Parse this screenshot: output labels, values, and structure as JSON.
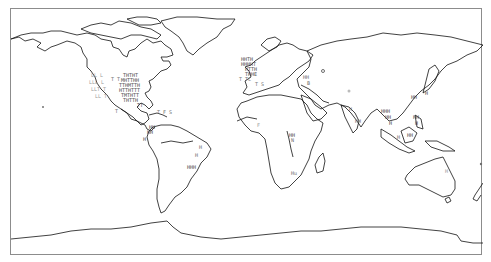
{
  "map": {
    "projection": "equirectangular",
    "frame": {
      "x": 10,
      "y": 8,
      "width": 472,
      "height": 247
    },
    "colors": {
      "coastline": "#111111",
      "frame": "#8c8c8c",
      "marker_dark": "#4a4a4a",
      "marker_mid": "#6e6e6e",
      "marker_light": "#9a9a9a"
    },
    "marker_clusters": [
      {
        "region": "Eastern United States",
        "density": "very high",
        "shade": "dark"
      },
      {
        "region": "Western United States",
        "density": "medium",
        "shade": "light"
      },
      {
        "region": "Western Europe",
        "density": "very high",
        "shade": "dark"
      },
      {
        "region": "Caribbean / Central America",
        "density": "low",
        "shade": "mid"
      },
      {
        "region": "Northern South America (Colombia/Venezuela)",
        "density": "medium",
        "shade": "dark"
      },
      {
        "region": "Eastern Brazil",
        "density": "medium",
        "shade": "mid"
      },
      {
        "region": "East Africa",
        "density": "low",
        "shade": "mid"
      },
      {
        "region": "Southern Africa",
        "density": "low",
        "shade": "mid"
      },
      {
        "region": "Caucasus / Middle East",
        "density": "low",
        "shade": "mid"
      },
      {
        "region": "India",
        "density": "low",
        "shade": "mid"
      },
      {
        "region": "Southeast Asia / Philippines",
        "density": "medium",
        "shade": "dark"
      },
      {
        "region": "Japan",
        "density": "low",
        "shade": "mid"
      },
      {
        "region": "Eastern Australia",
        "density": "low",
        "shade": "light"
      },
      {
        "region": "Pacific islands",
        "density": "very low",
        "shade": "mid"
      }
    ],
    "marker_glyphs": [
      "T",
      "L",
      "I",
      "H",
      "M",
      "F",
      "S",
      "C",
      "E",
      "N",
      "U",
      "B",
      "G",
      "Z",
      "P",
      "K",
      "D"
    ]
  }
}
